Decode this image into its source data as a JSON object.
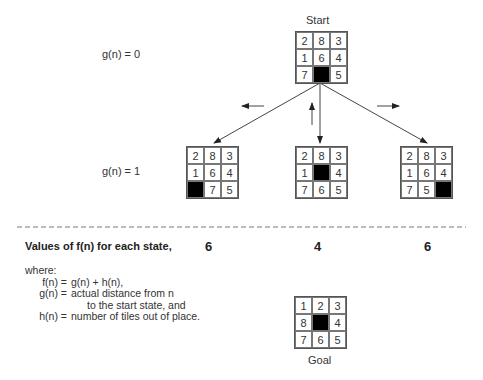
{
  "diagram": {
    "start": {
      "label": "Start",
      "cells": [
        "2",
        "8",
        "3",
        "1",
        "6",
        "4",
        "7",
        "",
        "5"
      ]
    },
    "levels": [
      {
        "label": "g(n) = 0"
      },
      {
        "label": "g(n) = 1"
      }
    ],
    "move_arrows": [
      "left",
      "up",
      "right"
    ],
    "children": [
      {
        "cells": [
          "2",
          "8",
          "3",
          "1",
          "6",
          "4",
          "",
          "7",
          "5"
        ],
        "f_value": "6"
      },
      {
        "cells": [
          "2",
          "8",
          "3",
          "1",
          "",
          "4",
          "7",
          "6",
          "5"
        ],
        "f_value": "4"
      },
      {
        "cells": [
          "2",
          "8",
          "3",
          "1",
          "6",
          "4",
          "7",
          "5",
          ""
        ],
        "f_value": "6"
      }
    ],
    "values_label": "Values of f(n) for each state,",
    "legend": {
      "where": "where:",
      "rows": [
        {
          "lhs": "f(n) =",
          "rhs": "g(n)  +  h(n),"
        },
        {
          "lhs": "g(n) =",
          "rhs": "actual distance from n"
        },
        {
          "lhs": "",
          "rhs": "to the start state, and"
        },
        {
          "lhs": "h(n) =",
          "rhs": "number of tiles out of place."
        }
      ]
    },
    "goal": {
      "label": "Goal",
      "cells": [
        "1",
        "2",
        "3",
        "8",
        "",
        "4",
        "7",
        "6",
        "5"
      ]
    }
  }
}
